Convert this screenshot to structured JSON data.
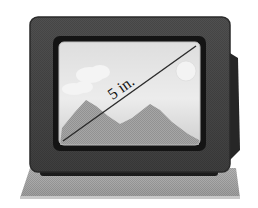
{
  "figure": {
    "diagonal_label": "5 in.",
    "measurement": {
      "value": 5,
      "unit": "in.",
      "dimension": "screen diagonal"
    }
  },
  "colors": {
    "background": "#ffffff",
    "tv_body": "#4d4d4d",
    "tv_body_edge": "#2a2a2a",
    "bezel": "#151515",
    "screen_top": "#dcdcdc",
    "screen_bottom": "#c4c4c4",
    "mountains": "#9a9a9a",
    "clouds": "#f2f2f2",
    "sun": "#ededed",
    "diagonal_line": "#2b2b2b",
    "table": "#a8a8a8",
    "table_edge": "#8c8c8c"
  }
}
